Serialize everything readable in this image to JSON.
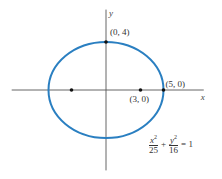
{
  "diagram": {
    "type": "ellipse",
    "title": "",
    "ellipse": {
      "a": 5,
      "b": 4,
      "center": [
        0,
        0
      ],
      "color": "#2a7fc1"
    },
    "axes": {
      "x_label": "x",
      "y_label": "y",
      "x_range": [
        -8.2,
        8.5
      ],
      "y_range": [
        -6.7,
        6.7
      ],
      "color": "#555555"
    },
    "points": [
      {
        "name": "vertex-top",
        "x": 0,
        "y": 4,
        "label": "(0, 4)"
      },
      {
        "name": "vertex-right",
        "x": 5,
        "y": 0,
        "label": "(5, 0)"
      },
      {
        "name": "focus-right",
        "x": 3,
        "y": 0,
        "label": "(3, 0)"
      },
      {
        "name": "focus-left",
        "x": -3,
        "y": 0,
        "label": ""
      }
    ],
    "equation": {
      "term1_num": "x",
      "term1_den": "25",
      "term2_num": "y",
      "term2_den": "16",
      "exponent": "2",
      "plus": "+",
      "rhs": "= 1"
    }
  }
}
